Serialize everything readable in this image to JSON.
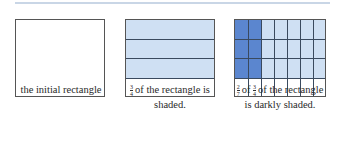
{
  "figure": {
    "colors": {
      "light_shade": "#cfe0f3",
      "dark_shade": "#5b86cf",
      "grid_line": "#3a4a5e",
      "border": "#555555",
      "top_rule": "#c9d6e6"
    },
    "panels": [
      {
        "id": "initial",
        "rows": 4,
        "columns": 1,
        "shaded_rows": 0,
        "caption": "the initial rectangle"
      },
      {
        "id": "three-quarters",
        "rows": 4,
        "columns": 1,
        "shaded_rows": 3,
        "caption_fraction": {
          "numerator": "3",
          "denominator": "4"
        },
        "caption_line1": "of the rectangle is",
        "caption_line2": "shaded."
      },
      {
        "id": "two-sevenths-of-three-quarters",
        "rows": 4,
        "columns": 7,
        "shaded_rows": 3,
        "dark_columns": 2,
        "caption_fraction_a": {
          "numerator": "2",
          "denominator": "7"
        },
        "caption_of": "of",
        "caption_fraction_b": {
          "numerator": "3",
          "denominator": "4"
        },
        "caption_line1": "of the rectangle",
        "caption_line2": "is darkly shaded."
      }
    ]
  }
}
